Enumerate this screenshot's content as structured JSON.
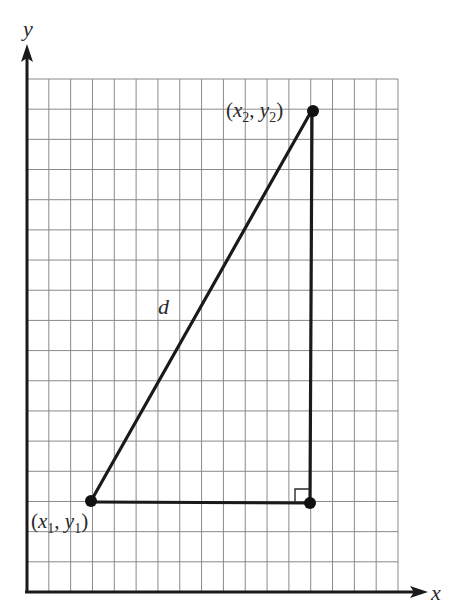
{
  "figure": {
    "type": "distance-formula right triangle on grid",
    "grid": {
      "columns": 17,
      "rows": 17,
      "line_color": "#8a8a8a"
    },
    "axes": {
      "x_label": "x",
      "y_label": "y",
      "color": "#1a1a1a"
    },
    "points": [
      {
        "id": "p1",
        "label_open": "(",
        "label_x": "x",
        "label_x_sub": "1",
        "label_sep": ", ",
        "label_y": "y",
        "label_y_sub": "1",
        "label_close": ")",
        "grid_x": 3,
        "grid_y": 3
      },
      {
        "id": "p2",
        "label_open": "(",
        "label_x": "x",
        "label_x_sub": "2",
        "label_sep": ", ",
        "label_y": "y",
        "label_y_sub": "2",
        "label_close": ")",
        "grid_x": 13,
        "grid_y": 16
      },
      {
        "id": "corner",
        "grid_x": 13,
        "grid_y": 3
      }
    ],
    "hypotenuse_label": "d",
    "right_angle_marker": true
  }
}
